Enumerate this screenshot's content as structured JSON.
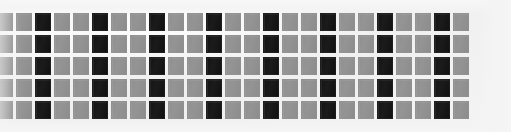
{
  "image": {
    "title": "Repeating square grid pattern",
    "width": 511,
    "height": 132,
    "background_color": "#f2f2f2"
  },
  "pattern": {
    "type": "grid",
    "rows": 5,
    "columns": 25,
    "cell_width": 16,
    "cell_height": 18,
    "column_pitch": 19,
    "row_pitch": 22,
    "origin_x": -3,
    "origin_y": 13,
    "gray_color": "#909090",
    "dark_color": "#141414",
    "dark_column_period": 3,
    "dark_column_offset": 2,
    "dark_column_indices": [
      2,
      5,
      8,
      11,
      14,
      17,
      20,
      23
    ],
    "row_labels": [
      "row-1",
      "row-2",
      "row-3",
      "row-4",
      "row-5"
    ],
    "cell_states": [
      "gray",
      "dark"
    ],
    "rows_data": [
      [
        "gray",
        "gray",
        "dark",
        "gray",
        "gray",
        "dark",
        "gray",
        "gray",
        "dark",
        "gray",
        "gray",
        "dark",
        "gray",
        "gray",
        "dark",
        "gray",
        "gray",
        "dark",
        "gray",
        "gray",
        "dark",
        "gray",
        "gray",
        "dark",
        "gray"
      ],
      [
        "gray",
        "gray",
        "dark",
        "gray",
        "gray",
        "dark",
        "gray",
        "gray",
        "dark",
        "gray",
        "gray",
        "dark",
        "gray",
        "gray",
        "dark",
        "gray",
        "gray",
        "dark",
        "gray",
        "gray",
        "dark",
        "gray",
        "gray",
        "dark",
        "gray"
      ],
      [
        "gray",
        "gray",
        "dark",
        "gray",
        "gray",
        "dark",
        "gray",
        "gray",
        "dark",
        "gray",
        "gray",
        "dark",
        "gray",
        "gray",
        "dark",
        "gray",
        "gray",
        "dark",
        "gray",
        "gray",
        "dark",
        "gray",
        "gray",
        "dark",
        "gray"
      ],
      [
        "gray",
        "gray",
        "dark",
        "gray",
        "gray",
        "dark",
        "gray",
        "gray",
        "dark",
        "gray",
        "gray",
        "dark",
        "gray",
        "gray",
        "dark",
        "gray",
        "gray",
        "dark",
        "gray",
        "gray",
        "dark",
        "gray",
        "gray",
        "dark",
        "gray"
      ],
      [
        "gray",
        "gray",
        "dark",
        "gray",
        "gray",
        "dark",
        "gray",
        "gray",
        "dark",
        "gray",
        "gray",
        "dark",
        "gray",
        "gray",
        "dark",
        "gray",
        "gray",
        "dark",
        "gray",
        "gray",
        "dark",
        "gray",
        "gray",
        "dark",
        "gray"
      ]
    ]
  }
}
